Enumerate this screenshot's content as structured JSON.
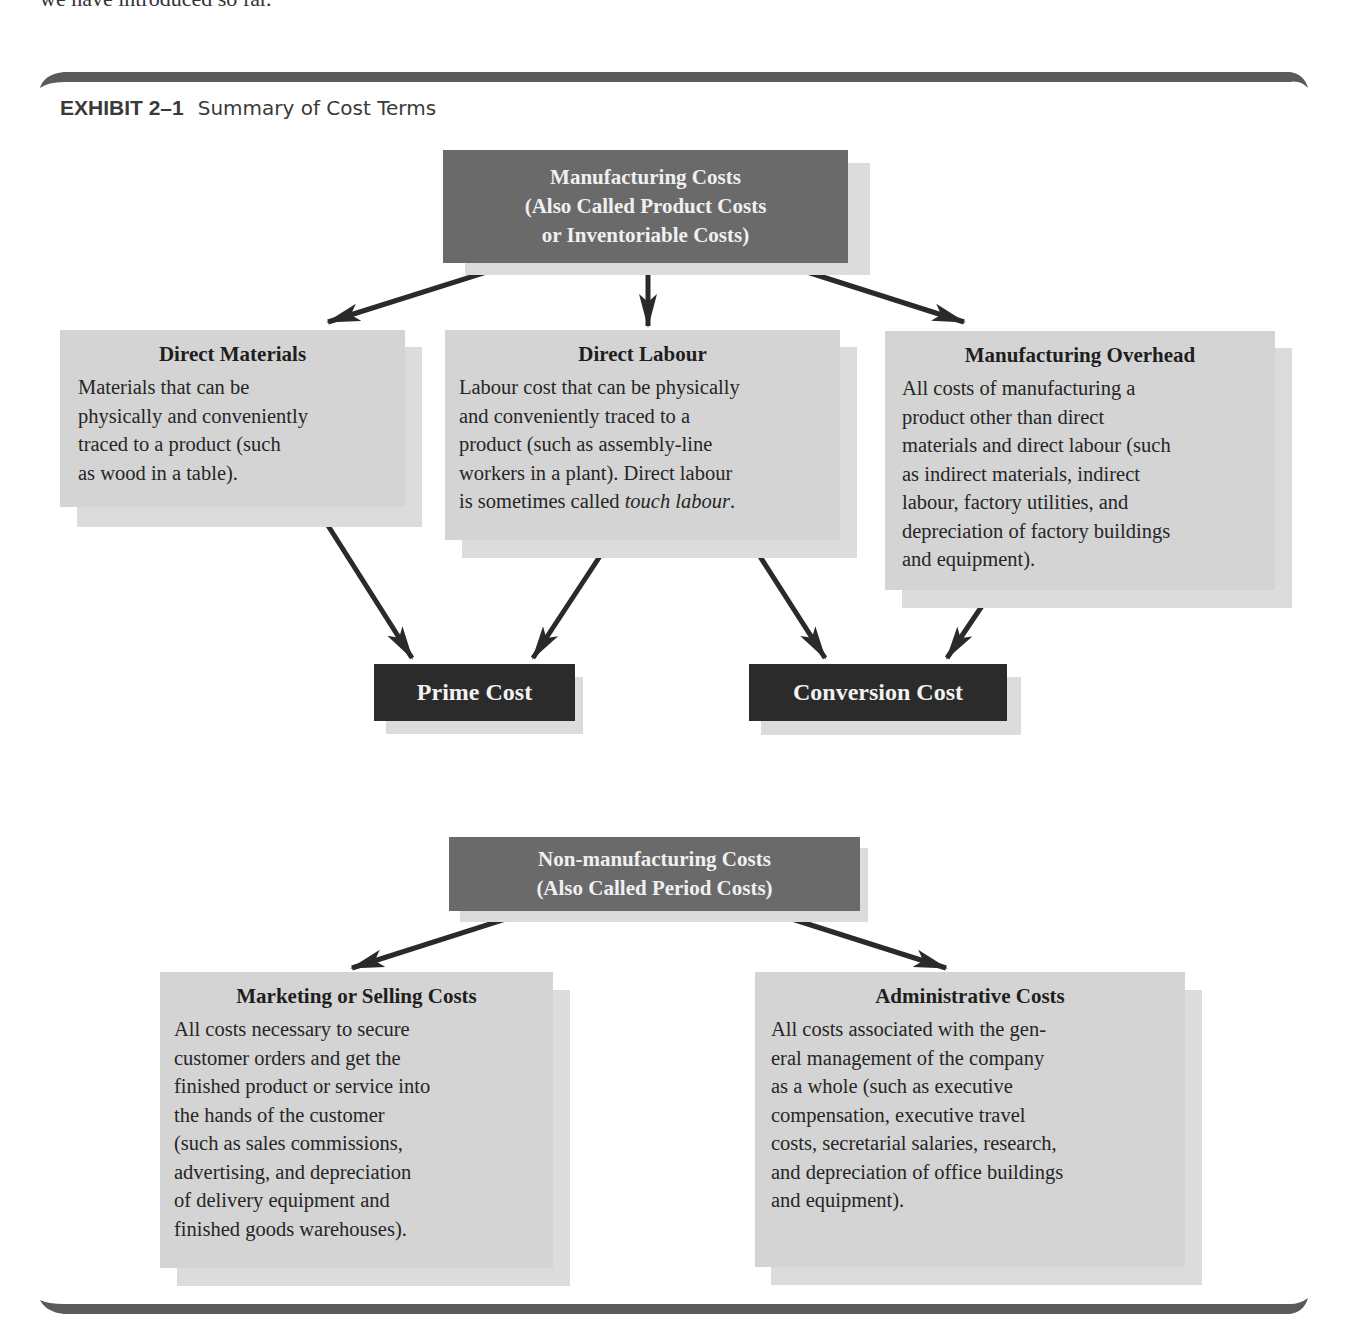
{
  "page": {
    "intro_fragment": "we have introduced so far."
  },
  "exhibit": {
    "number": "EXHIBIT 2–1",
    "caption": "Summary of Cost Terms"
  },
  "manufacturing_costs": {
    "lines": [
      "Manufacturing Costs",
      "(Also Called Product Costs",
      "or Inventoriable Costs)"
    ]
  },
  "direct_materials": {
    "heading": "Direct Materials",
    "body": "Materials that can be\nphysically and conveniently\ntraced to a product (such\nas wood in a table)."
  },
  "direct_labour": {
    "heading": "Direct Labour",
    "body_plain": "Labour cost that can be physically\nand conveniently traced to a\nproduct (such as assembly-line\nworkers in a plant). Direct labour\nis sometimes called ",
    "body_italic": "touch labour",
    "body_end": "."
  },
  "manufacturing_overhead": {
    "heading": "Manufacturing Overhead",
    "body": "All costs of manufacturing a\nproduct other than direct\nmaterials and direct labour (such\nas indirect materials, indirect\nlabour, factory utilities, and\ndepreciation of factory buildings\nand equipment)."
  },
  "prime_cost": {
    "label": "Prime Cost"
  },
  "conversion_cost": {
    "label": "Conversion Cost"
  },
  "non_manufacturing_costs": {
    "lines": [
      "Non-manufacturing Costs",
      "(Also Called Period Costs)"
    ]
  },
  "marketing_costs": {
    "heading": "Marketing or Selling Costs",
    "body": "All costs necessary to secure\ncustomer orders and get the\nfinished product or service into\nthe hands of the customer\n(such as sales commissions,\nadvertising, and depreciation\nof delivery equipment and\nfinished goods warehouses)."
  },
  "administrative_costs": {
    "heading": "Administrative Costs",
    "body": "All costs associated with the gen-\neral management of the company\nas a whole (such as executive\ncompensation, executive travel\ncosts, secretarial salaries, research,\nand depreciation of office buildings\nand equipment)."
  },
  "colors": {
    "header_box": "#6a6a6a",
    "result_box": "#2b2b2b",
    "content_box": "#d4d4d4",
    "shadow": "#dcdcdc",
    "arrow": "#2a2a2a",
    "rule": "#5a5a5a"
  }
}
